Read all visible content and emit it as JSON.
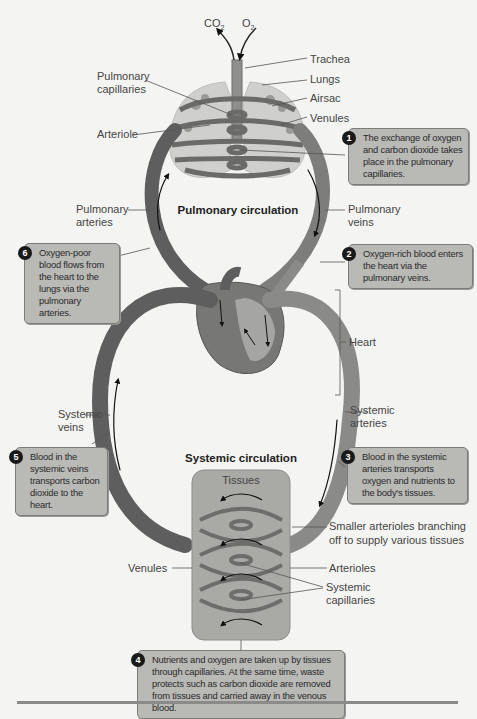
{
  "figure": {
    "top_labels": {
      "co2": "CO",
      "co2_sub": "2",
      "o2": "O",
      "o2_sub": "2"
    },
    "labels": {
      "trachea": "Trachea",
      "lungs": "Lungs",
      "airsac": "Airsac",
      "venules_top": "Venules",
      "pulmonary_capillaries_1": "Pulmonary",
      "pulmonary_capillaries_2": "capillaries",
      "arteriole": "Arteriole",
      "pulmonary_arteries_1": "Pulmonary",
      "pulmonary_arteries_2": "arteries",
      "pulmonary_veins_1": "Pulmonary",
      "pulmonary_veins_2": "veins",
      "heart": "Heart",
      "systemic_veins_1": "Systemic",
      "systemic_veins_2": "veins",
      "systemic_arteries_1": "Systemic",
      "systemic_arteries_2": "arteries",
      "tissues": "Tissues",
      "smaller_arterioles_1": "Smaller arterioles branching",
      "smaller_arterioles_2": "off to supply various tissues",
      "venules_bottom": "Venules",
      "arterioles": "Arterioles",
      "systemic_capillaries_1": "Systemic",
      "systemic_capillaries_2": "capillaries"
    },
    "section_titles": {
      "pulmonary": "Pulmonary circulation",
      "systemic": "Systemic circulation"
    },
    "notes": [
      {
        "num": "1",
        "text": "The exchange of oxygen and carbon dioxide takes place in the pulmonary capillaries."
      },
      {
        "num": "2",
        "text": "Oxygen-rich blood enters the heart via the pulmonary veins."
      },
      {
        "num": "3",
        "text": "Blood in the systemic arteries transports oxygen and nutrients to the body's tissues."
      },
      {
        "num": "4",
        "text": "Nutrients and oxygen are taken up by tissues through capillaries. At the same time, waste protects such as carbon dioxide are removed from tissues and carried away in the venous blood."
      },
      {
        "num": "5",
        "text": "Blood in the systemic veins transports carbon dioxide to the heart."
      },
      {
        "num": "6",
        "text": "Oxygen-poor blood flows from the heart to the lungs via the pulmonary arteries."
      }
    ],
    "colors": {
      "vessel_dark": "#5e5e5e",
      "vessel_light": "#8c8c8c",
      "lung_fill": "#c9c9c7",
      "tissue_box": "#a9a9a6",
      "note_box": "#b9b9b6",
      "background": "#f4f4f2"
    }
  }
}
